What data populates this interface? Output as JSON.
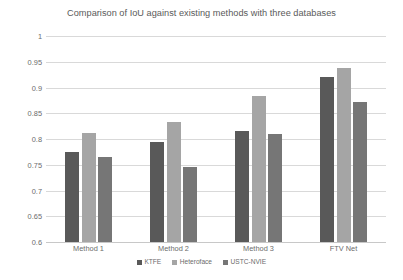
{
  "chart_data": {
    "type": "bar",
    "title": "Comparison of IoU against existing methods with three databases",
    "xlabel": "",
    "ylabel": "",
    "ylim": [
      0.6,
      1
    ],
    "yticks": [
      "0.6",
      "0.65",
      "0.7",
      "0.75",
      "0.8",
      "0.85",
      "0.9",
      "0.95",
      "1"
    ],
    "ytick_values": [
      0.6,
      0.65,
      0.7,
      0.75,
      0.8,
      0.85,
      0.9,
      0.95,
      1
    ],
    "grid": true,
    "legend_position": "bottom",
    "categories": [
      "Method 1",
      "Method 2",
      "Method 3",
      "FTV Net"
    ],
    "series": [
      {
        "name": "KTFE",
        "color": "#595959",
        "values": [
          0.775,
          0.795,
          0.815,
          0.921
        ]
      },
      {
        "name": "Heteroface",
        "color": "#a5a5a5",
        "values": [
          0.812,
          0.833,
          0.883,
          0.938
        ]
      },
      {
        "name": "USTC-NVIE",
        "color": "#767676",
        "values": [
          0.766,
          0.745,
          0.81,
          0.872
        ]
      }
    ]
  },
  "colors": {
    "gridline": "#d9d9d9",
    "axis": "#c8c8c8",
    "text": "#6b6b6b",
    "title": "#5a5a5a",
    "background": "#ffffff"
  }
}
